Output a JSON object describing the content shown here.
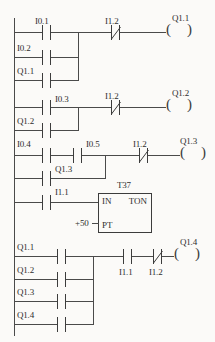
{
  "diagram": {
    "type": "ladder-logic",
    "line_color": "#4a4a4a",
    "background_color": "#fbfaf8"
  },
  "rungs": [
    {
      "id": "rung-1",
      "series_contacts": [
        {
          "label": "I0.1",
          "kind": "NO"
        },
        {
          "label": "I1.2",
          "kind": "NC"
        }
      ],
      "parallel_contacts": [
        {
          "label": "I0.2",
          "kind": "NO"
        },
        {
          "label": "Q1.1",
          "kind": "NO"
        }
      ],
      "coil": {
        "label": "Q1.1"
      }
    },
    {
      "id": "rung-2",
      "series_contacts": [
        {
          "label": "I0.3",
          "kind": "NO"
        },
        {
          "label": "I1.2",
          "kind": "NC"
        }
      ],
      "parallel_contacts": [
        {
          "label": "Q1.2",
          "kind": "NO"
        }
      ],
      "coil": {
        "label": "Q1.2"
      }
    },
    {
      "id": "rung-3",
      "series_contacts": [
        {
          "label": "I0.4",
          "kind": "NO"
        },
        {
          "label": "I0.5",
          "kind": "NO"
        },
        {
          "label": "I1.2",
          "kind": "NC"
        }
      ],
      "parallel_contacts": [
        {
          "label": "Q1.3",
          "kind": "NO"
        }
      ],
      "coil": {
        "label": "Q1.3"
      }
    },
    {
      "id": "rung-4-timer",
      "series_contacts": [
        {
          "label": "I1.1",
          "kind": "NO"
        }
      ],
      "timer": {
        "name": "T37",
        "type": "TON",
        "in_label": "IN",
        "pt_label": "PT",
        "preset": "+50"
      }
    },
    {
      "id": "rung-5",
      "parallel_contacts": [
        {
          "label": "Q1.1",
          "kind": "NO"
        },
        {
          "label": "Q1.2",
          "kind": "NO"
        },
        {
          "label": "Q1.3",
          "kind": "NO"
        },
        {
          "label": "Q1.4",
          "kind": "NO"
        }
      ],
      "series_contacts": [
        {
          "label": "I1.1",
          "kind": "NO"
        },
        {
          "label": "I1.2",
          "kind": "NC"
        }
      ],
      "coil": {
        "label": "Q1.4"
      }
    }
  ],
  "labels": {
    "r1_c1": "I0.1",
    "r1_c2": "I1.2",
    "r1_b1": "I0.2",
    "r1_b2": "Q1.1",
    "r1_coil": "Q1.1",
    "r2_c1": "I0.3",
    "r2_c2": "I1.2",
    "r2_b1": "Q1.2",
    "r2_coil": "Q1.2",
    "r3_c1": "I0.4",
    "r3_c2": "I0.5",
    "r3_c3": "I1.2",
    "r3_b1": "Q1.3",
    "r3_coil": "Q1.3",
    "r4_c1": "I1.1",
    "r4_timer_name": "T37",
    "r4_in": "IN",
    "r4_ton": "TON",
    "r4_pt": "PT",
    "r4_preset": "+50",
    "r5_b1": "Q1.1",
    "r5_b2": "Q1.2",
    "r5_b3": "Q1.3",
    "r5_b4": "Q1.4",
    "r5_c1": "I1.1",
    "r5_c2": "I1.2",
    "r5_coil": "Q1.4"
  }
}
